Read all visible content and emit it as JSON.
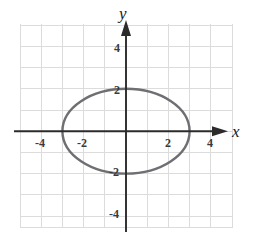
{
  "figure": {
    "width": 255,
    "height": 238,
    "background_color": "#ffffff"
  },
  "chart_data": {
    "type": "line",
    "title": "",
    "xlabel": "x",
    "ylabel": "y",
    "grid": true,
    "legend": null,
    "xlim": [
      -5,
      5
    ],
    "ylim": [
      -4.8,
      4.8
    ],
    "xticks": [
      -4,
      -2,
      2,
      4
    ],
    "yticks": [
      -4,
      -2,
      2,
      4
    ],
    "xtick_labels": [
      "-4",
      "-2",
      "2",
      "4"
    ],
    "ytick_labels": [
      "-4",
      "-2",
      "2",
      "4"
    ],
    "tick_step": 1,
    "grid_color": "#dcdcdc",
    "axis_color": "#2b2b2b",
    "curve_color": "#6e6e73",
    "series": [
      {
        "name": "ellipse",
        "shape": "ellipse",
        "center": [
          0,
          0
        ],
        "semi_axis_x": 3,
        "semi_axis_y": 2,
        "equation": "x^2/9 + y^2/4 = 1",
        "x_intercepts": [
          -3,
          3
        ],
        "y_intercepts": [
          -2,
          2
        ],
        "stroke_width": 2.4
      }
    ]
  },
  "labels": {
    "axis_x": "x",
    "axis_y": "y",
    "x_neg_4": "-4",
    "x_neg_2": "-2",
    "x_pos_2": "2",
    "x_pos_4": "4",
    "y_neg_4": "-4",
    "y_neg_2": "-2",
    "y_pos_2": "2",
    "y_pos_4": "4"
  }
}
